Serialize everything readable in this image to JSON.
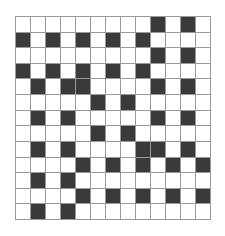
{
  "pattern": {
    "rows": 13,
    "cols": 13,
    "colors": {
      "dark": "#3a3a3a",
      "light": "#ffffff",
      "gridline": "#999999"
    },
    "dark_cells": [
      [
        9,
        11
      ],
      [
        0,
        2,
        4,
        6,
        8
      ],
      [
        9,
        11
      ],
      [
        0,
        2,
        4,
        6,
        8
      ],
      [
        1,
        3,
        4,
        9,
        11
      ],
      [
        5,
        7
      ],
      [
        1,
        3,
        9,
        11
      ],
      [
        5,
        7
      ],
      [
        1,
        3,
        8,
        9,
        11
      ],
      [
        4,
        6,
        8,
        10,
        12
      ],
      [
        1,
        3
      ],
      [
        4,
        6,
        8,
        10,
        12
      ],
      [
        1,
        3
      ]
    ]
  }
}
